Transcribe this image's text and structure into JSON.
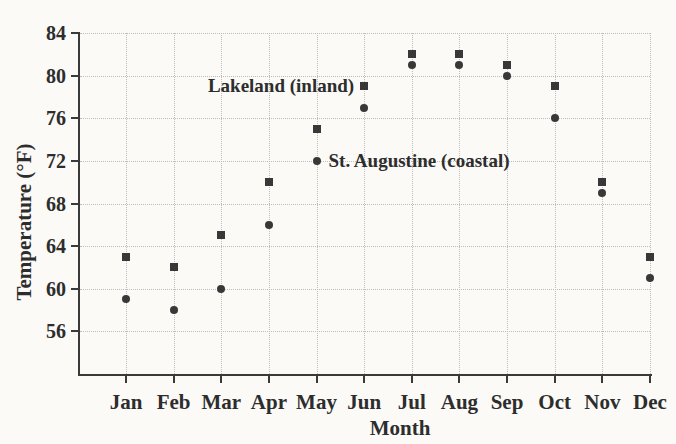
{
  "chart_data": {
    "type": "scatter",
    "title": "",
    "xlabel": "Month",
    "ylabel": "Temperature (°F)",
    "categories": [
      "Jan",
      "Feb",
      "Mar",
      "Apr",
      "May",
      "Jun",
      "Jul",
      "Aug",
      "Sep",
      "Oct",
      "Nov",
      "Dec"
    ],
    "ylim": [
      52,
      84
    ],
    "y_ticks": [
      56,
      60,
      64,
      68,
      72,
      76,
      80,
      84
    ],
    "grid": {
      "horizontal": "dotted",
      "vertical": "dotted"
    },
    "legend_position": "inline annotations next to May/Jun points",
    "series": [
      {
        "name": "Lakeland (inland)",
        "marker": "square",
        "values": [
          63,
          62,
          65,
          70,
          75,
          79,
          82,
          82,
          81,
          79,
          70,
          63
        ]
      },
      {
        "name": "St. Augustine (coastal)",
        "marker": "circle",
        "values": [
          59,
          58,
          60,
          66,
          72,
          77,
          81,
          81,
          80,
          76,
          69,
          61
        ]
      }
    ],
    "annotations": [
      {
        "text": "Lakeland (inland)",
        "anchor_category": "Jun",
        "anchor_value": 79,
        "side": "left-of-point"
      },
      {
        "text": "St. Augustine (coastal)",
        "anchor_category": "May",
        "anchor_value": 72,
        "side": "right-of-point"
      }
    ],
    "colors": {
      "marker": "#383838",
      "text": "#2d2d2d",
      "grid": "#bdbdbd",
      "axis": "#3a3a3a",
      "background": "#fbfaf7"
    }
  }
}
